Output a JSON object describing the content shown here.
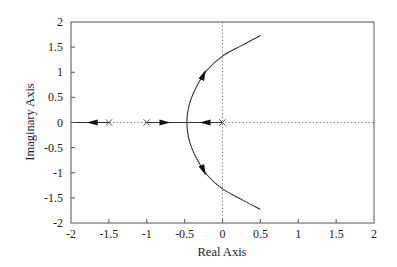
{
  "chart_data": {
    "type": "line",
    "title": "",
    "subtitle": "Root locus plot",
    "xlabel": "Real Axis",
    "ylabel": "Imaginary Axis",
    "xlim": [
      -2,
      2
    ],
    "ylim": [
      -2,
      2
    ],
    "xticks": [
      -2,
      -1.5,
      -1,
      -0.5,
      0,
      0.5,
      1,
      1.5,
      2
    ],
    "yticks": [
      -2,
      -1.5,
      -1,
      -0.5,
      0,
      0.5,
      1,
      1.5,
      2
    ],
    "xtick_labels": [
      "-2",
      "-1.5",
      "-1",
      "-0.5",
      "0",
      "0.5",
      "1",
      "1.5",
      "2"
    ],
    "ytick_labels": [
      "-2",
      "-1.5",
      "-1",
      "-0.5",
      "0",
      "0.5",
      "1",
      "1.5",
      "2"
    ],
    "grid": false,
    "zero_lines": "dotted",
    "poles": [
      {
        "re": -1.5,
        "im": 0,
        "marker": "x"
      },
      {
        "re": -1.0,
        "im": 0,
        "marker": "x"
      },
      {
        "re": 0.0,
        "im": 0,
        "marker": "x"
      }
    ],
    "series": [
      {
        "name": "real-axis branch to -infinity",
        "points": [
          [
            -1.5,
            0
          ],
          [
            -2,
            0
          ]
        ],
        "arrows": [
          {
            "at": [
              -1.72,
              0
            ],
            "dir": "left"
          }
        ]
      },
      {
        "name": "real-axis branch from -1 to breakaway",
        "points": [
          [
            -1.0,
            0
          ],
          [
            -0.47,
            0
          ]
        ],
        "arrows": [
          {
            "at": [
              -0.76,
              0
            ],
            "dir": "right"
          }
        ]
      },
      {
        "name": "real-axis branch from 0 to breakaway",
        "points": [
          [
            0.0,
            0
          ],
          [
            -0.47,
            0
          ]
        ],
        "arrows": [
          {
            "at": [
              -0.23,
              0
            ],
            "dir": "left"
          }
        ]
      },
      {
        "name": "upper complex branch",
        "points": [
          [
            -0.47,
            0
          ],
          [
            -0.46,
            0.2
          ],
          [
            -0.42,
            0.45
          ],
          [
            -0.33,
            0.75
          ],
          [
            -0.2,
            1.05
          ],
          [
            0.0,
            1.32
          ],
          [
            0.25,
            1.53
          ],
          [
            0.5,
            1.73
          ]
        ],
        "arrows": [
          {
            "at": [
              -0.25,
              0.95
            ],
            "dir": "up-right"
          }
        ]
      },
      {
        "name": "lower complex branch",
        "points": [
          [
            -0.47,
            0
          ],
          [
            -0.46,
            -0.2
          ],
          [
            -0.42,
            -0.45
          ],
          [
            -0.33,
            -0.75
          ],
          [
            -0.2,
            -1.05
          ],
          [
            0.0,
            -1.32
          ],
          [
            0.25,
            -1.53
          ],
          [
            0.5,
            -1.73
          ]
        ],
        "arrows": [
          {
            "at": [
              -0.25,
              -0.95
            ],
            "dir": "down-right"
          }
        ]
      }
    ],
    "colors": {
      "line": "#333333",
      "frame": "#555555",
      "zero_line": "#888888",
      "marker": "#555555"
    }
  },
  "plot_area": {
    "left": 71,
    "top": 22,
    "right": 374,
    "bottom": 223
  }
}
